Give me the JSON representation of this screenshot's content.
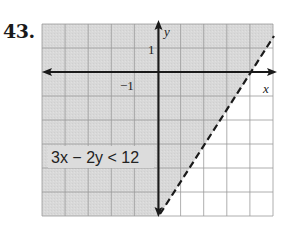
{
  "problem": {
    "number": "43.",
    "inequality": "3x − 2y < 12",
    "boundary_line": "3x − 2y = 12",
    "boundary_style": "dashed",
    "shaded_side": "above/left of line (contains origin)"
  },
  "axes": {
    "x_label": "x",
    "y_label": "y",
    "x_tick_label": "−1",
    "y_tick_label": "1",
    "x_range": [
      -5,
      5
    ],
    "y_range": [
      -6,
      2
    ]
  },
  "colors": {
    "shade": "#d6d6d6",
    "grid": "#9a9a9a",
    "axis": "#1a1a1a",
    "background": "#ffffff"
  }
}
